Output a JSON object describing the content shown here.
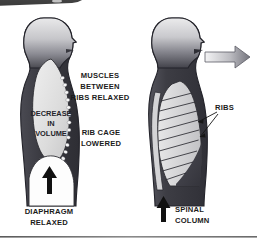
{
  "figure": {
    "title_banner": {
      "present": true,
      "shape": "rounded-dark-tab-cropped",
      "color": "#4a4a4a"
    },
    "background_color": "#ffffff",
    "divider": {
      "present": true,
      "color": "#6d6d6d"
    },
    "palette": {
      "ink": "#1b1b1b",
      "body_dark": "#3c3c42",
      "body_mid": "#7b7b83",
      "body_light": "#d8d8da",
      "cavity_fill": "#e3e3e3",
      "rib_fill": "#d0d0d2",
      "arrow_black": "#111111",
      "arrow_gradient_light": "#f2f2f2",
      "arrow_gradient_dark": "#7e7e86",
      "outline": "#2a2a2e",
      "dot_marker": "#fafafa"
    },
    "panels": [
      {
        "id": "left-panel",
        "name": "exhalation-cross-section",
        "figure_name": "human-torso-side-view-sectioned",
        "labels": [
          {
            "id": "muscles-between-ribs",
            "lines": [
              "MUSCLES",
              "BETWEEN",
              "RIBS RELAXED"
            ]
          },
          {
            "id": "decrease-in-volume",
            "lines": [
              "DECREASE",
              "IN",
              "VOLUME"
            ]
          },
          {
            "id": "rib-cage-lowered",
            "lines": [
              "RIB CAGE",
              "LOWERED"
            ]
          },
          {
            "id": "diaphragm-relaxed",
            "lines": [
              "DIAPHRAGM",
              "RELAXED"
            ]
          }
        ],
        "arrows": [
          {
            "id": "diaphragm-up-arrow",
            "direction": "up",
            "style": "solid-black"
          }
        ]
      },
      {
        "id": "right-panel",
        "name": "rib-cage-skeletal-view",
        "figure_name": "human-torso-side-view-ribs",
        "rib_count": 9,
        "labels": [
          {
            "id": "ribs",
            "lines": [
              "RIBS"
            ]
          },
          {
            "id": "spinal-column",
            "lines": [
              "SPINAL",
              "COLUMN"
            ]
          }
        ],
        "arrows": [
          {
            "id": "exhale-air-arrow",
            "direction": "right",
            "style": "gradient-outlined"
          },
          {
            "id": "spinal-column-up-arrow",
            "direction": "up",
            "style": "solid-black"
          },
          {
            "id": "ribs-pointer-upper",
            "direction": "left",
            "style": "thin-leader"
          },
          {
            "id": "ribs-pointer-lower",
            "direction": "left",
            "style": "thin-leader"
          }
        ]
      }
    ]
  }
}
